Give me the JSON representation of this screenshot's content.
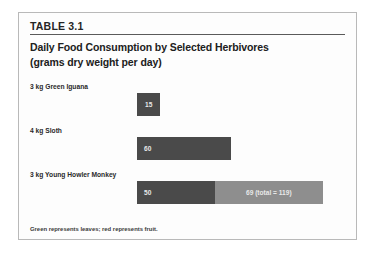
{
  "figure": {
    "table_number": "TABLE 3.1",
    "title_line_1": "Daily Food Consumption by Selected Herbivores",
    "title_line_2": "(grams dry weight per day)",
    "footnote": "Green represents leaves; red represents fruit."
  },
  "colors": {
    "leaves_bar": "#4a4a4a",
    "fruit_bar": "#8e8e8e",
    "frame_border": "#b9b9b9",
    "rule": "#5a5a5a",
    "bar_value_text": "#e8e8e8"
  },
  "chart_data": {
    "type": "bar",
    "title": "Daily Food Consumption by Selected Herbivores",
    "subtitle": "(grams dry weight per day)",
    "xlabel": "",
    "ylabel": "",
    "orientation": "horizontal",
    "stacked": true,
    "grid": false,
    "legend_position": "bottom-note",
    "units": "grams dry weight per day",
    "categories": [
      "3 kg Green Iguana",
      "4 kg Sloth",
      "3 kg Young Howler Monkey"
    ],
    "series": [
      {
        "name": "Leaves",
        "color_note": "green",
        "values": [
          15,
          60,
          50
        ]
      },
      {
        "name": "Fruit",
        "color_note": "red",
        "values": [
          0,
          0,
          69
        ]
      }
    ],
    "totals": [
      15,
      60,
      119
    ],
    "xlim": [
      0,
      125
    ],
    "rows": [
      {
        "label": "3 kg Green Iguana",
        "segments": [
          {
            "type": "leaves",
            "value": 15,
            "value_label": "15",
            "label_align": "center"
          }
        ],
        "total": 15
      },
      {
        "label": "4 kg Sloth",
        "segments": [
          {
            "type": "leaves",
            "value": 60,
            "value_label": "60",
            "label_align": "left"
          }
        ],
        "total": 60
      },
      {
        "label": "3 kg Young Howler Monkey",
        "segments": [
          {
            "type": "leaves",
            "value": 50,
            "value_label": "50",
            "label_align": "left"
          },
          {
            "type": "fruit",
            "value": 69,
            "value_label": "69 (total = 119)",
            "label_align": "center"
          }
        ],
        "total": 119
      }
    ]
  }
}
